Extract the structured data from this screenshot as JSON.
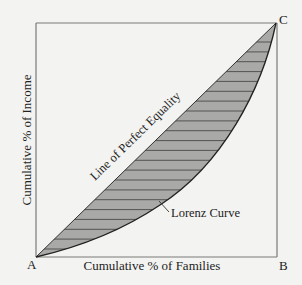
{
  "diagram": {
    "type": "lorenz-curve",
    "points": {
      "A": {
        "label": "A"
      },
      "B": {
        "label": "B"
      },
      "C": {
        "label": "C"
      }
    },
    "x_axis_label": "Cumulative % of Families",
    "y_axis_label": "Cumulative % of Income",
    "equality_line_label": "Line of Perfect Equality",
    "lorenz_curve_label": "Lorenz Curve",
    "colors": {
      "background": "#f3f3f1",
      "frame": "#7a7a7a",
      "shaded_area": "#a9a9a7",
      "hatch": "#4a4a4a",
      "curve": "#222222",
      "text": "#222222"
    },
    "hatch_line_count": 22
  }
}
